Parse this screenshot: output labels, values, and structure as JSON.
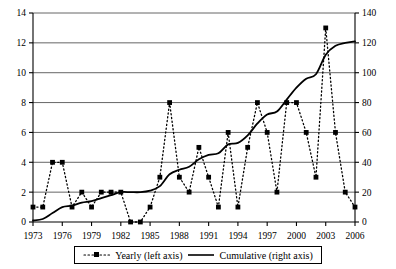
{
  "chart_data": {
    "type": "line",
    "title": "",
    "subtitle": "",
    "xlabel": "",
    "ylabel": "",
    "y2label": "",
    "x": [
      1973,
      1974,
      1975,
      1976,
      1977,
      1978,
      1979,
      1980,
      1981,
      1982,
      1983,
      1984,
      1985,
      1986,
      1987,
      1988,
      1989,
      1990,
      1991,
      1992,
      1993,
      1994,
      1995,
      1996,
      1997,
      1998,
      1999,
      2000,
      2001,
      2002,
      2003,
      2004,
      2005,
      2006
    ],
    "xlim": [
      1973,
      2006
    ],
    "xticks": [
      1973,
      1976,
      1979,
      1982,
      1985,
      1988,
      1991,
      1994,
      1997,
      2000,
      2003,
      2006
    ],
    "xtick_labels": [
      "1973",
      "1976",
      "1979",
      "1982",
      "1985",
      "1988",
      "1991",
      "1994",
      "1997",
      "2000",
      "2003",
      "2006"
    ],
    "ylim": [
      0,
      14
    ],
    "yticks": [
      0,
      2,
      4,
      6,
      8,
      10,
      12,
      14
    ],
    "ytick_labels": [
      "0",
      "2",
      "4",
      "6",
      "8",
      "10",
      "12",
      "14"
    ],
    "y2lim": [
      0,
      140
    ],
    "y2ticks": [
      0,
      20,
      40,
      60,
      80,
      100,
      120,
      140
    ],
    "y2tick_labels": [
      "0",
      "20",
      "40",
      "60",
      "80",
      "100",
      "120",
      "140"
    ],
    "grid": true,
    "grid_axis": "y",
    "legend_position": "bottom",
    "series": [
      {
        "name": "Yearly (left axis)",
        "axis": "left",
        "style": "dotted",
        "marker": "square",
        "color": "#000000",
        "values": [
          1,
          1,
          4,
          4,
          1,
          2,
          1,
          2,
          2,
          2,
          0,
          0,
          1,
          3,
          8,
          3,
          2,
          5,
          3,
          1,
          6,
          1,
          5,
          8,
          6,
          2,
          8,
          8,
          6,
          3,
          13,
          6,
          2,
          1
        ]
      },
      {
        "name": "Cumulative (right axis)",
        "axis": "right",
        "style": "solid",
        "marker": "none",
        "color": "#000000",
        "values": [
          1,
          2,
          6,
          10,
          11,
          13,
          14,
          16,
          18,
          20,
          20,
          20,
          21,
          24,
          32,
          35,
          37,
          42,
          45,
          46,
          52,
          53,
          58,
          66,
          72,
          74,
          82,
          90,
          96,
          99,
          112,
          118,
          120,
          121
        ]
      }
    ]
  },
  "legend": {
    "entries": [
      {
        "label": "Yearly (left axis)",
        "style": "dotted-marker"
      },
      {
        "label": "Cumulative (right axis)",
        "style": "solid-line"
      }
    ]
  }
}
